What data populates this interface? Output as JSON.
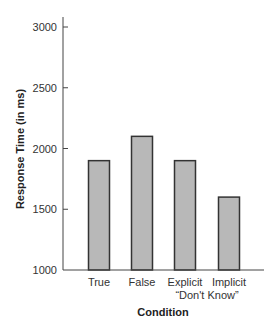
{
  "chart_data": {
    "type": "bar",
    "title": "",
    "xlabel": "Condition",
    "ylabel": "Response Time (in ms)",
    "categories": [
      "True",
      "False",
      "Explicit \"Don't Know\"",
      "Implicit \"Don't Know\""
    ],
    "category_labels": [
      {
        "line1": "True",
        "line2": ""
      },
      {
        "line1": "False",
        "line2": ""
      },
      {
        "line1": "Explicit",
        "line2": ""
      },
      {
        "line1": "Implicit",
        "line2": ""
      }
    ],
    "shared_sublabel": "“Don't Know”",
    "values": [
      1900,
      2100,
      1900,
      1600
    ],
    "ylim": [
      1000,
      3000
    ],
    "yticks": [
      1000,
      1500,
      2000,
      2500,
      3000
    ],
    "grid": false,
    "legend": null,
    "colors": {
      "bar_fill": "#b8b8b8",
      "bar_stroke": "#333333",
      "axis": "#444444"
    }
  }
}
